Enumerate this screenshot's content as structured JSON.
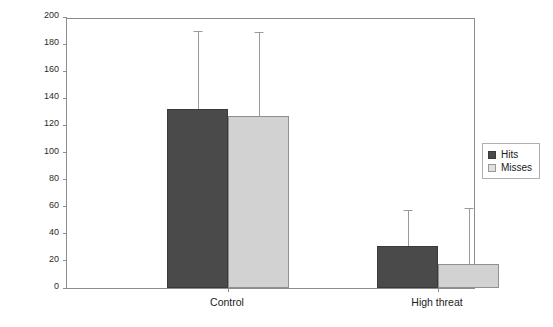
{
  "chart_data": {
    "type": "bar",
    "title": "",
    "subtitle": "",
    "xlabel": "",
    "ylabel": "Composite score",
    "categories": [
      "Control",
      "High threat"
    ],
    "series": [
      {
        "name": "Hits",
        "color": "#4a4a4a",
        "values": [
          132,
          31
        ],
        "error_upper": [
          189,
          57
        ]
      },
      {
        "name": "Misses",
        "color": "#d2d2d2",
        "values": [
          127,
          18
        ],
        "error_upper": [
          188,
          58
        ]
      }
    ],
    "ylim": [
      0,
      200
    ],
    "yticks": [
      0,
      20,
      40,
      60,
      80,
      100,
      120,
      140,
      160,
      180,
      200
    ],
    "ytick_labels": [
      "0",
      "20",
      "40",
      "60",
      "80",
      "100",
      "120",
      "140",
      "160",
      "180",
      "200"
    ],
    "grid": false,
    "legend_position": "right",
    "error_bar_style": "upper-only-with-cap",
    "frame": "box"
  },
  "legend": {
    "items": [
      {
        "label": "Hits",
        "swatch": "hits-swatch"
      },
      {
        "label": "Misses",
        "swatch": "misses-swatch"
      }
    ]
  }
}
